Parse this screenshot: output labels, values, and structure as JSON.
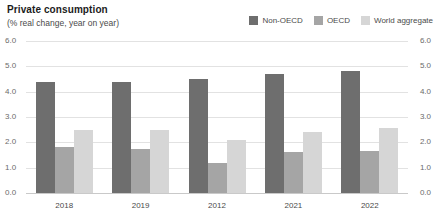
{
  "header": {
    "title": "Private consumption",
    "subtitle": "(% real change, year on year)"
  },
  "legend": {
    "items": [
      {
        "label": "Non-OECD",
        "color": "#6e6e6e"
      },
      {
        "label": "OECD",
        "color": "#a5a5a5"
      },
      {
        "label": "World aggregate",
        "color": "#d6d6d6"
      }
    ]
  },
  "chart_data": {
    "type": "bar",
    "title": "Private consumption",
    "subtitle": "(% real change, year on year)",
    "xlabel": "",
    "ylabel": "(% real change, year on year)",
    "ylim": [
      0,
      6
    ],
    "ytick_labels": [
      "6.0",
      "5.0",
      "4.0",
      "3.0",
      "2.0",
      "1.0",
      "0.0"
    ],
    "ytick_values": [
      6,
      5,
      4,
      3,
      2,
      1,
      0
    ],
    "y_axis_right": true,
    "grid": true,
    "legend_position": "top-right",
    "categories": [
      "2018",
      "2019",
      "2012",
      "2021",
      "2022"
    ],
    "series": [
      {
        "name": "Non-OECD",
        "color": "#6e6e6e",
        "values": [
          4.4,
          4.4,
          4.5,
          4.7,
          4.8
        ]
      },
      {
        "name": "OECD",
        "color": "#a5a5a5",
        "values": [
          1.8,
          1.75,
          1.2,
          1.6,
          1.65
        ]
      },
      {
        "name": "World aggregate",
        "color": "#d6d6d6",
        "values": [
          2.5,
          2.5,
          2.1,
          2.4,
          2.55
        ]
      }
    ]
  }
}
